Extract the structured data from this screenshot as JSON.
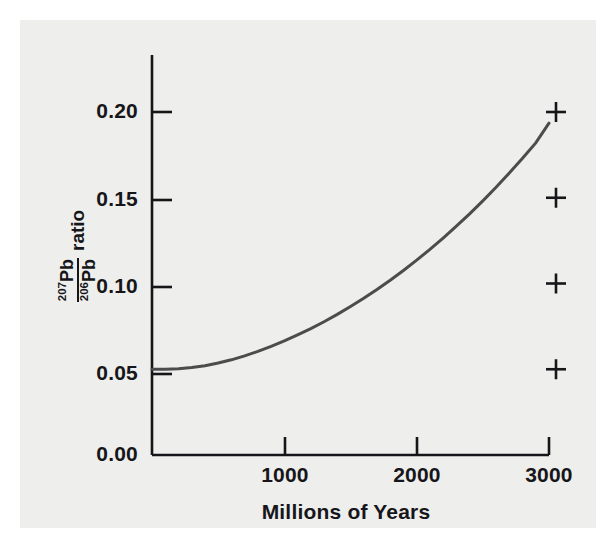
{
  "figure": {
    "background_color": "#ffffff",
    "panel_color": "#eeeeec",
    "ink_color": "#16161a",
    "curve_color": "#4c4c4c"
  },
  "chart_data": {
    "type": "line",
    "title": "",
    "subtitle": "",
    "xlabel": "Millions of Years",
    "ylabel_numerator": "207Pb",
    "ylabel_denominator": "206Pb",
    "ylabel_suffix": "ratio",
    "ylabel_plain": "207Pb / 206Pb ratio",
    "xlim": [
      0,
      3000
    ],
    "ylim": [
      0.0,
      0.225
    ],
    "xticks": [
      1000,
      2000,
      3000
    ],
    "xtick_labels": [
      "1000",
      "2000",
      "3000"
    ],
    "yticks": [
      0.0,
      0.05,
      0.1,
      0.15,
      0.2
    ],
    "ytick_labels": [
      "0.00",
      "0.05",
      "0.10",
      "0.15",
      "0.20"
    ],
    "grid": false,
    "legend": false,
    "series": [
      {
        "name": "207Pb/206Pb growth curve",
        "style": "smooth-curve",
        "color": "#4c4c4c",
        "x": [
          0,
          100,
          200,
          300,
          400,
          500,
          600,
          700,
          800,
          900,
          1000,
          1100,
          1200,
          1300,
          1400,
          1500,
          1600,
          1700,
          1800,
          1900,
          2000,
          2100,
          2200,
          2300,
          2400,
          2500,
          2600,
          2700,
          2800,
          2900,
          3000
        ],
        "y": [
          0.05,
          0.05,
          0.0503,
          0.051,
          0.0521,
          0.0536,
          0.0555,
          0.0578,
          0.0604,
          0.0633,
          0.0665,
          0.07,
          0.0737,
          0.0777,
          0.082,
          0.0866,
          0.0914,
          0.0965,
          0.1019,
          0.1076,
          0.1136,
          0.1199,
          0.1265,
          0.1334,
          0.1406,
          0.1482,
          0.1561,
          0.1644,
          0.173,
          0.182,
          0.1935
        ]
      },
      {
        "name": "reference markers",
        "style": "plus-markers",
        "color": "#16161a",
        "marker": "+",
        "x": [
          3100,
          3100,
          3100,
          3100
        ],
        "y": [
          0.2,
          0.15,
          0.1,
          0.05
        ]
      }
    ]
  },
  "axes": {
    "y_tick_labels": [
      "0.20",
      "0.15",
      "0.10",
      "0.05",
      "0.00"
    ],
    "x_tick_labels": [
      "1000",
      "2000",
      "3000"
    ],
    "x_axis_title": "Millions of Years"
  },
  "markers": {
    "glyph": "+",
    "count": 4
  }
}
